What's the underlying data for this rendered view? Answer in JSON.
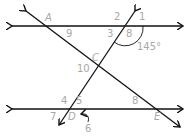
{
  "diagram": {
    "type": "parallel lines cut by transversals",
    "line_color": "#111111",
    "label_color": "#a8a8a8",
    "points": [
      {
        "name": "A",
        "x": 45,
        "y": 13
      },
      {
        "name": "C",
        "x": 92,
        "y": 53
      },
      {
        "name": "D",
        "x": 68,
        "y": 112
      },
      {
        "name": "E",
        "x": 154,
        "y": 112
      }
    ],
    "angle_labels": [
      {
        "name": "1",
        "x": 139,
        "y": 12
      },
      {
        "name": "2",
        "x": 114,
        "y": 12
      },
      {
        "name": "3",
        "x": 107,
        "y": 29
      },
      {
        "name": "8",
        "x": 126,
        "y": 29
      },
      {
        "name": "9",
        "x": 66,
        "y": 29
      },
      {
        "name": "10",
        "x": 77,
        "y": 64
      },
      {
        "name": "4",
        "x": 61,
        "y": 96
      },
      {
        "name": "5",
        "x": 76,
        "y": 96
      },
      {
        "name": "7",
        "x": 50,
        "y": 112
      },
      {
        "name": "6",
        "x": 85,
        "y": 124
      },
      {
        "name": "8",
        "x": 132,
        "y": 96
      }
    ],
    "angle_measure": {
      "text": "145°",
      "x": 137,
      "y": 42
    }
  }
}
